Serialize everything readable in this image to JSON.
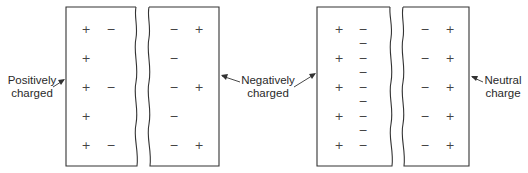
{
  "figure": {
    "left_pair": {
      "left_label": [
        "Positively",
        "charged"
      ],
      "right_label": [
        "Negatively",
        "charged"
      ],
      "left_block": {
        "charges": [
          [
            "+",
            "−"
          ],
          [
            "+"
          ],
          [
            "+",
            "−"
          ],
          [
            "+"
          ],
          [
            "+",
            "−"
          ]
        ]
      },
      "right_block": {
        "charges": [
          [
            "−",
            "+"
          ],
          [
            "−"
          ],
          [
            "−",
            "+"
          ],
          [
            "−"
          ],
          [
            "−",
            "+"
          ]
        ]
      }
    },
    "right_pair": {
      "right_label": [
        "Neutral",
        "charge"
      ],
      "left_block": {
        "charges": [
          [
            "+",
            "−"
          ],
          [
            "−"
          ],
          [
            "+",
            "−"
          ],
          [
            "−"
          ],
          [
            "+",
            "−"
          ],
          [
            "−"
          ],
          [
            "+",
            "−"
          ],
          [
            "−"
          ],
          [
            "+",
            "−"
          ]
        ]
      },
      "right_block": {
        "charges": [
          [
            "−",
            "+"
          ],
          [
            "−",
            "+"
          ],
          [
            "−",
            "+"
          ],
          [
            "−",
            "+"
          ],
          [
            "−",
            "+"
          ]
        ]
      }
    },
    "colors": {
      "line": "#333333",
      "text": "#2a2a2a"
    }
  }
}
